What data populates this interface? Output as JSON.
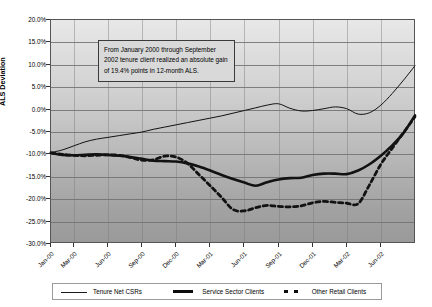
{
  "chart_data": {
    "type": "line",
    "title": "",
    "xlabel": "Month",
    "ylabel": "ALS Deviation",
    "ylim": [
      -30,
      20
    ],
    "ytick_labels": [
      "20.0%",
      "15.0%",
      "10.0%",
      "5.0%",
      "0.0%",
      "-5.0%",
      "-10.0%",
      "-15.0%",
      "-20.0%",
      "-25.0%",
      "-30.0%"
    ],
    "ytick_values": [
      20,
      15,
      10,
      5,
      0,
      -5,
      -10,
      -15,
      -20,
      -25,
      -30
    ],
    "grid": true,
    "legend_position": "bottom",
    "categories": [
      "Jan-00",
      "Feb-00",
      "Mar-00",
      "Apr-00",
      "May-00",
      "Jun-00",
      "Jul-00",
      "Aug-00",
      "Sep-00",
      "Oct-00",
      "Nov-00",
      "Dec-00",
      "Jan-01",
      "Feb-01",
      "Mar-01",
      "Apr-01",
      "May-01",
      "Jun-01",
      "Jul-01",
      "Aug-01",
      "Sep-01",
      "Oct-01",
      "Nov-01",
      "Dec-01",
      "Jan-02",
      "Feb-02",
      "Mar-02",
      "Apr-02",
      "May-02",
      "Jun-02",
      "Jul-02",
      "Aug-02",
      "Sep-02"
    ],
    "xtick_labels": [
      "Jan-00",
      "Mar-00",
      "Jun-00",
      "Sep-00",
      "Dec-00",
      "Mar-01",
      "Jun-01",
      "Sep-01",
      "Dec-01",
      "Mar-02",
      "Jun-02"
    ],
    "xtick_indices": [
      0,
      2,
      5,
      8,
      11,
      14,
      17,
      20,
      23,
      26,
      29
    ],
    "series": [
      {
        "name": "Tenure Net CSRs",
        "style": "thin-solid",
        "values": [
          -9.6,
          -9.0,
          -8.1,
          -7.2,
          -6.6,
          -6.2,
          -5.8,
          -5.4,
          -5.0,
          -4.4,
          -3.9,
          -3.4,
          -2.9,
          -2.4,
          -1.9,
          -1.4,
          -0.8,
          -0.2,
          0.4,
          1.0,
          1.3,
          0.3,
          -0.3,
          -0.2,
          0.2,
          0.6,
          0.2,
          -1.0,
          -0.7,
          1.0,
          3.6,
          6.6,
          9.8
        ]
      },
      {
        "name": "Service Sector Clients",
        "style": "thick-solid",
        "values": [
          -9.7,
          -10.1,
          -10.2,
          -10.1,
          -10.0,
          -10.1,
          -10.3,
          -10.6,
          -11.0,
          -11.4,
          -11.5,
          -11.6,
          -12.0,
          -12.7,
          -13.6,
          -14.6,
          -15.5,
          -16.3,
          -17.0,
          -16.2,
          -15.6,
          -15.3,
          -15.2,
          -14.6,
          -14.3,
          -14.3,
          -14.4,
          -13.6,
          -12.2,
          -10.3,
          -8.0,
          -5.2,
          -1.3
        ]
      },
      {
        "name": "Other Retail Clients",
        "style": "thick-dashed",
        "values": [
          -9.6,
          -10.0,
          -10.2,
          -10.3,
          -10.2,
          -10.1,
          -10.2,
          -10.7,
          -11.3,
          -11.2,
          -10.4,
          -10.6,
          -12.0,
          -14.5,
          -17.0,
          -19.6,
          -22.3,
          -22.6,
          -21.9,
          -21.4,
          -21.6,
          -21.7,
          -21.5,
          -20.8,
          -20.5,
          -20.7,
          -20.9,
          -21.0,
          -16.8,
          -12.2,
          -8.6,
          -5.1,
          -1.6
        ]
      }
    ],
    "annotation": {
      "text": "From January 2000 through September 2002 tenure client realized an absolute gain of 19.4% points in 12-month ALS."
    }
  }
}
